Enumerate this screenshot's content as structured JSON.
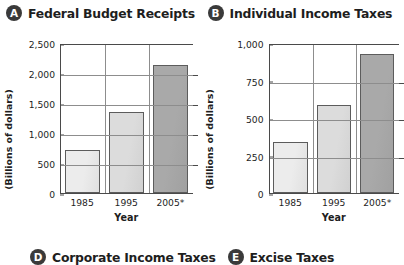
{
  "panels": [
    {
      "badge": "A",
      "title": "Federal Budget Receipts",
      "ylabel": "(Billions of dollars)",
      "xlabel": "Year",
      "chart_data": {
        "type": "bar",
        "title": "Federal Budget Receipts",
        "categories": [
          "1985",
          "1995",
          "2005*"
        ],
        "values": [
          725,
          1350,
          2130
        ],
        "xlabel": "Year",
        "ylabel": "(Billions of dollars)",
        "ylim": [
          0,
          2500
        ],
        "yticks": [
          "0",
          "500",
          "1,000",
          "1,500",
          "2,000",
          "2,500"
        ],
        "ytick_values": [
          0,
          500,
          1000,
          1500,
          2000,
          2500
        ],
        "grid": "horizontal",
        "legend": "none",
        "bar_colors": [
          "#ececec",
          "#dcdcdc",
          "#a9a9a9"
        ]
      }
    },
    {
      "badge": "B",
      "title": "Individual Income Taxes",
      "ylabel": "(Billions of dollars)",
      "xlabel": "Year",
      "chart_data": {
        "type": "bar",
        "title": "Individual Income Taxes",
        "categories": [
          "1985",
          "1995",
          "2005*"
        ],
        "values": [
          340,
          590,
          930
        ],
        "xlabel": "Year",
        "ylabel": "(Billions of dollars)",
        "ylim": [
          0,
          1000
        ],
        "yticks": [
          "0",
          "250",
          "500",
          "750",
          "1,000"
        ],
        "ytick_values": [
          0,
          250,
          500,
          750,
          1000
        ],
        "grid": "horizontal",
        "legend": "none",
        "bar_colors": [
          "#ececec",
          "#dcdcdc",
          "#a9a9a9"
        ]
      }
    }
  ],
  "bottom_row": [
    {
      "badge": "D",
      "title": "Corporate Income Taxes"
    },
    {
      "badge": "E",
      "title": "Excise Taxes"
    }
  ],
  "colors": {
    "badge_bg": "#3a3a3a",
    "badge_fg": "#ffffff",
    "axis": "#4a4a4a",
    "gridline": "#8d8d8d",
    "text": "#1e1e1e"
  }
}
